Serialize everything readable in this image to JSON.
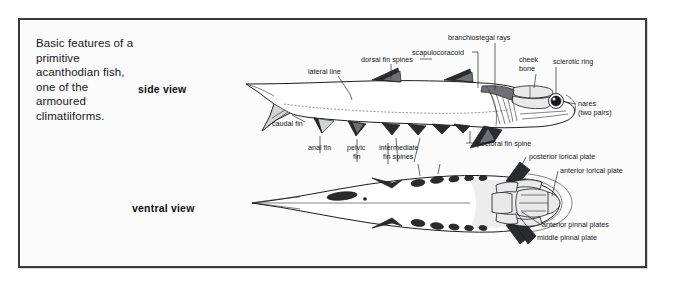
{
  "figure": {
    "caption": "Basic features of a primitive acanthodian fish, one of the armoured climatiiforms.",
    "frame_color": "#3a3a3c",
    "background_color": "#fbfbfb"
  },
  "views": {
    "side": {
      "label": "side view"
    },
    "ventral": {
      "label": "ventral view"
    }
  },
  "labels": {
    "lateral_line": "lateral line",
    "dorsal_fin_spines": "dorsal fin spines",
    "branchiostegal_rays": "branchiostegal rays",
    "scapulocoracoid": "scapulocoracoid",
    "cheek_bone_line1": "cheek",
    "cheek_bone_line2": "bone",
    "sclerotic_ring": "sclerotic ring",
    "nares_line1": "nares",
    "nares_line2": "(two pairs)",
    "caudal_fin": "caudal fin",
    "anal_fin": "anal fin",
    "pelvic_fin_line1": "pelvic",
    "pelvic_fin_line2": "fin",
    "intermediate_line1": "intermediate",
    "intermediate_line2": "fin spines",
    "pectoral_fin_spine": "pectoral fin spine",
    "posterior_lorical_plate": "posterior lorical plate",
    "anterior_lorical_plate": "anterior lorical plate",
    "anterior_pinnal_plates": "anterior pinnal plates",
    "middle_pinnal_plate": "middle pinnal plate"
  }
}
